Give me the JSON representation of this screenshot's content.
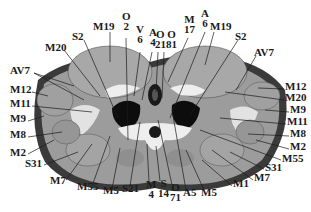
{
  "figure": {
    "type": "anatomical-cross-section",
    "colors": {
      "background": "#ffffff",
      "skin_outline": "#3a3a3a",
      "muscle_dark": "#8a8a8a",
      "muscle_mid": "#9c9c9c",
      "muscle_light": "#a8a8a8",
      "fat_light": "#d8d8d8",
      "bone_white": "#eeeeee",
      "cavity_black": "#0d0d0d",
      "label_text": "#1a1a1a"
    },
    "labels": [
      {
        "id": "m19-left",
        "text": "M19",
        "x": 93,
        "y": 25
      },
      {
        "id": "o2-left",
        "text_lines": [
          "O",
          "2"
        ],
        "x": 122,
        "y": 15
      },
      {
        "id": "v6",
        "text_lines": [
          "V",
          "6"
        ],
        "x": 136,
        "y": 28
      },
      {
        "id": "a4",
        "text_lines": [
          "A",
          "4"
        ],
        "x": 149,
        "y": 31
      },
      {
        "id": "o21-o81",
        "text_lines": [
          "O O",
          "2181"
        ],
        "x": 155,
        "y": 33
      },
      {
        "id": "m17",
        "text_lines": [
          "M",
          "17"
        ],
        "x": 184,
        "y": 18
      },
      {
        "id": "a6",
        "text_lines": [
          "A",
          "6"
        ],
        "x": 201,
        "y": 12
      },
      {
        "id": "m19-right",
        "text": "M19",
        "x": 210,
        "y": 25
      },
      {
        "id": "s2-left",
        "text": "S2",
        "x": 72,
        "y": 35
      },
      {
        "id": "s2-right",
        "text": "S2",
        "x": 235,
        "y": 35
      },
      {
        "id": "m20-left",
        "text": "M20",
        "x": 45,
        "y": 46
      },
      {
        "id": "av7-left",
        "text": "AV7",
        "x": 10,
        "y": 69
      },
      {
        "id": "av7-right",
        "text": "AV7",
        "x": 254,
        "y": 51
      },
      {
        "id": "m12-left",
        "text": "M12",
        "x": 10,
        "y": 88
      },
      {
        "id": "m12-right",
        "text": "M12",
        "x": 285,
        "y": 85
      },
      {
        "id": "m20-right",
        "text": "M20",
        "x": 285,
        "y": 96
      },
      {
        "id": "m11-left",
        "text": "M11",
        "x": 10,
        "y": 102
      },
      {
        "id": "m9-right",
        "text": "M9",
        "x": 290,
        "y": 108
      },
      {
        "id": "m9-left",
        "text": "M9",
        "x": 10,
        "y": 117
      },
      {
        "id": "m11-right",
        "text": "M11",
        "x": 287,
        "y": 120
      },
      {
        "id": "m8-left",
        "text": "M8",
        "x": 10,
        "y": 133
      },
      {
        "id": "m8-right",
        "text": "M8",
        "x": 290,
        "y": 132
      },
      {
        "id": "m2-left",
        "text": "M2",
        "x": 10,
        "y": 151
      },
      {
        "id": "m2-right",
        "text": "M2",
        "x": 290,
        "y": 145
      },
      {
        "id": "s31-left",
        "text": "S31",
        "x": 25,
        "y": 162
      },
      {
        "id": "m55-right",
        "text": "M55",
        "x": 282,
        "y": 157
      },
      {
        "id": "s31-right",
        "text": "S31",
        "x": 265,
        "y": 166
      },
      {
        "id": "m7-left",
        "text": "M7",
        "x": 50,
        "y": 179
      },
      {
        "id": "m7-right",
        "text": "M7",
        "x": 254,
        "y": 176
      },
      {
        "id": "m1",
        "text": "M1",
        "x": 233,
        "y": 182
      },
      {
        "id": "m55-left",
        "text": "M55",
        "x": 77,
        "y": 185
      },
      {
        "id": "m5-left",
        "text": "M5",
        "x": 103,
        "y": 189
      },
      {
        "id": "s21",
        "text": "S21",
        "x": 122,
        "y": 187
      },
      {
        "id": "m4",
        "text_lines": [
          "M",
          "4"
        ],
        "x": 146,
        "y": 183
      },
      {
        "id": "s14",
        "text_lines": [
          "S",
          "14"
        ],
        "x": 158,
        "y": 182
      },
      {
        "id": "o71",
        "text_lines": [
          "O",
          "71"
        ],
        "x": 170,
        "y": 186
      },
      {
        "id": "a5",
        "text": "A5",
        "x": 183,
        "y": 191
      },
      {
        "id": "m5-right",
        "text": "M5",
        "x": 201,
        "y": 191
      }
    ]
  }
}
